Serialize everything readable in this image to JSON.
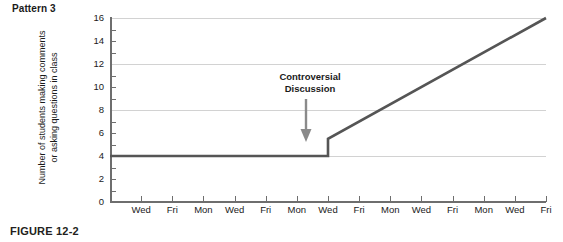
{
  "pattern_label": "Pattern 3",
  "figure_caption": "FIGURE 12-2",
  "annotation": {
    "line1": "Controversial",
    "line2": "Discussion",
    "arrow_icon": "arrow-down-icon"
  },
  "y_axis_title": {
    "line1": "Number of students making comments",
    "line2": "or asking questions in class"
  },
  "colors": {
    "line": "#555555",
    "axis": "#6e6e6e",
    "grid": "#d2d2d2",
    "text": "#1a1a1a",
    "caption": "#231f20",
    "arrow": "#8a8a8a",
    "background": "#ffffff"
  },
  "chart_data": {
    "type": "line",
    "title": "Pattern 3",
    "xlabel": "",
    "ylabel": "Number of students making comments or asking questions in class",
    "ylim": [
      0,
      16
    ],
    "ytick_step": 2,
    "yticks": [
      0,
      2,
      4,
      6,
      8,
      10,
      12,
      14,
      16
    ],
    "gridlines": [
      4,
      8,
      12,
      16
    ],
    "grid": true,
    "legend": "none",
    "categories": [
      "Wed",
      "Fri",
      "Mon",
      "Wed",
      "Fri",
      "Mon",
      "Wed",
      "Fri",
      "Mon",
      "Wed",
      "Fri",
      "Mon",
      "Wed",
      "Fri"
    ],
    "x": [
      1,
      2,
      3,
      4,
      5,
      6,
      7,
      8,
      9,
      10,
      11,
      12,
      13,
      14
    ],
    "values": [
      4,
      4,
      4,
      4,
      4,
      4,
      4,
      6.7,
      8.0,
      9.3,
      10.7,
      12.0,
      13.3,
      16
    ],
    "series": [
      {
        "name": "Number of students making comments or asking questions in class",
        "values": [
          4,
          4,
          4,
          4,
          4,
          4,
          4,
          6.7,
          8.0,
          9.3,
          10.7,
          12.0,
          13.3,
          16
        ]
      }
    ],
    "discontinuity": {
      "at_category": "Wed",
      "at_x": 7,
      "value_before": 4,
      "value_after": 5.5,
      "label": "Controversial Discussion"
    },
    "annotations": [
      {
        "text": "Controversial Discussion",
        "points_to_x": 7,
        "points_to_y": 5.5
      }
    ]
  }
}
